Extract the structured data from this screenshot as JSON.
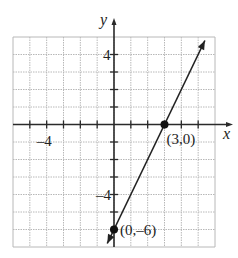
{
  "chart_data": {
    "type": "line",
    "title": "",
    "xlabel": "x",
    "ylabel": "y",
    "xlim": [
      -6,
      6
    ],
    "ylim": [
      -7,
      5
    ],
    "grid": true,
    "x_tick_labels": [
      {
        "value": -4,
        "label": "–4"
      }
    ],
    "y_tick_labels": [
      {
        "value": 4,
        "label": "4"
      },
      {
        "value": -4,
        "label": "–4"
      }
    ],
    "series": [
      {
        "name": "line",
        "equation": "y = 2x - 6",
        "x": [
          -0.4,
          5.4
        ],
        "y": [
          -6.8,
          4.8
        ]
      }
    ],
    "points": [
      {
        "x": 3,
        "y": 0,
        "label": "(3,0)"
      },
      {
        "x": 0,
        "y": -6,
        "label": "(0,–6)"
      }
    ],
    "colors": {
      "grid": "#b8b8b8",
      "axis": "#2a2a2a",
      "line": "#222222"
    }
  }
}
